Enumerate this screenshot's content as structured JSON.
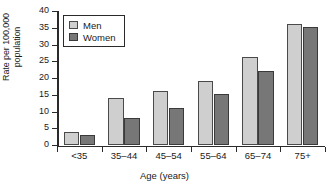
{
  "chart_data": {
    "type": "bar",
    "title": "",
    "xlabel": "Age (years)",
    "ylabel": "Rate per 100,000\npopulation",
    "categories": [
      "<35",
      "35–44",
      "45–54",
      "55–64",
      "65–74",
      "75+"
    ],
    "series": [
      {
        "name": "Men",
        "color": "#cfcfcf",
        "values": [
          3.7,
          14,
          16,
          19,
          26,
          36
        ]
      },
      {
        "name": "Women",
        "color": "#777777",
        "values": [
          2.9,
          8,
          11,
          15,
          22,
          35
        ]
      }
    ],
    "ylim": [
      0,
      40
    ],
    "ytick_values": [
      0,
      5,
      10,
      15,
      20,
      25,
      30,
      35,
      40
    ],
    "ytick_labels": [
      "0",
      "5",
      "10",
      "15",
      "20",
      "25",
      "30",
      "35",
      "40"
    ],
    "grid": false,
    "legend_position": "upper-left-inside"
  }
}
